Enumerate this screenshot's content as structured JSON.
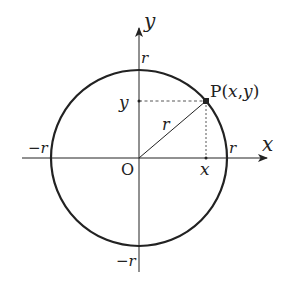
{
  "diagram": {
    "type": "unit-circle-coordinates",
    "origin_label": "O",
    "x_axis_label": "x",
    "y_axis_label": "y",
    "radius_label": "r",
    "tick_labels": {
      "x_positive": "r",
      "x_negative": "−r",
      "y_positive": "r",
      "y_negative": "−r",
      "x_point": "x",
      "y_point": "y"
    },
    "point": {
      "name": "P",
      "open": "(",
      "x": "x",
      "comma": ",",
      "y": "y",
      "close": ")"
    },
    "colors": {
      "stroke": "#222222",
      "background": "#ffffff"
    }
  }
}
